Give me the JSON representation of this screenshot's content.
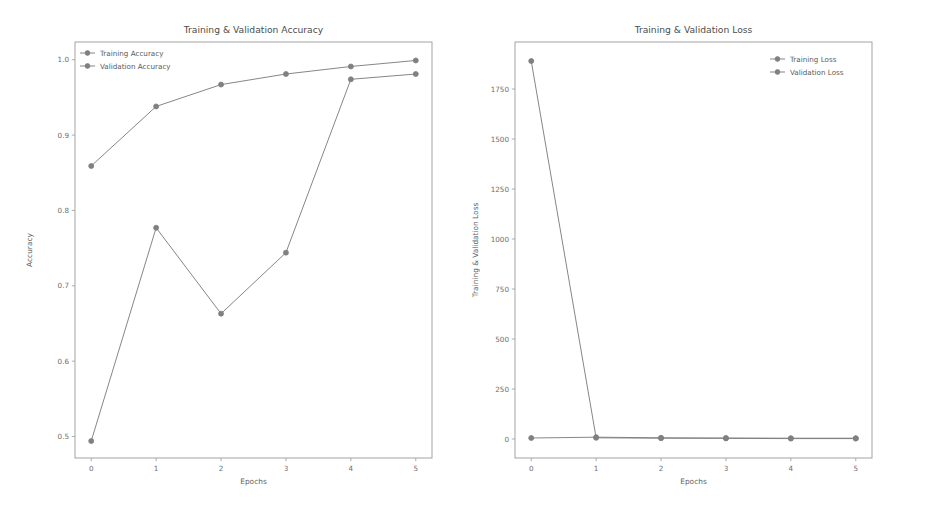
{
  "figure": {
    "background_color": "#ffffff",
    "width": 928,
    "height": 509,
    "panel_count": 2
  },
  "chart_data": [
    {
      "id": "accuracy-chart",
      "type": "line",
      "title": "Training & Validation Accuracy",
      "xlabel": "Epochs",
      "ylabel": "Accuracy",
      "x": [
        0,
        1,
        2,
        3,
        4,
        5
      ],
      "xlim": [
        -0.25,
        5.25
      ],
      "ylim": [
        0.4715,
        1.0235
      ],
      "xticks": [
        0,
        1,
        2,
        3,
        4,
        5
      ],
      "xtick_labels": [
        "0",
        "1",
        "2",
        "3",
        "4",
        "5"
      ],
      "yticks": [
        0.5,
        0.6,
        0.7,
        0.8,
        0.9,
        1.0
      ],
      "ytick_labels": [
        "0.5",
        "0.6",
        "0.7",
        "0.8",
        "0.9",
        "1.0"
      ],
      "grid": false,
      "legend_position": "upper left",
      "series": [
        {
          "name": "Training Accuracy",
          "color": "#808080",
          "marker": "circle",
          "values": [
            0.859,
            0.938,
            0.967,
            0.981,
            0.991,
            0.999
          ]
        },
        {
          "name": "Validation Accuracy",
          "color": "#808080",
          "marker": "circle",
          "values": [
            0.494,
            0.777,
            0.663,
            0.744,
            0.974,
            0.981
          ]
        }
      ]
    },
    {
      "id": "loss-chart",
      "type": "line",
      "title": "Training & Validation Loss",
      "xlabel": "Epochs",
      "ylabel": "Training & Validation Loss",
      "x": [
        0,
        1,
        2,
        3,
        4,
        5
      ],
      "xlim": [
        -0.25,
        5.25
      ],
      "ylim": [
        -95,
        1985
      ],
      "xticks": [
        0,
        1,
        2,
        3,
        4,
        5
      ],
      "xtick_labels": [
        "0",
        "1",
        "2",
        "3",
        "4",
        "5"
      ],
      "yticks": [
        0,
        250,
        500,
        750,
        1000,
        1250,
        1500,
        1750
      ],
      "ytick_labels": [
        "0",
        "250",
        "500",
        "750",
        "1000",
        "1250",
        "1500",
        "1750"
      ],
      "grid": false,
      "legend_position": "upper right",
      "series": [
        {
          "name": "Training Loss",
          "color": "#808080",
          "marker": "circle",
          "values": [
            1890,
            6,
            4,
            3,
            2,
            2
          ]
        },
        {
          "name": "Validation Loss",
          "color": "#808080",
          "marker": "circle",
          "values": [
            5,
            9,
            6,
            5,
            4,
            4
          ]
        }
      ]
    }
  ]
}
